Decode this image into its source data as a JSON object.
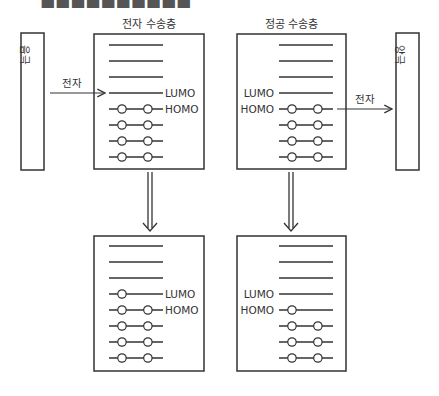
{
  "header_cut_text": "■■■■■■■■■■",
  "colors": {
    "stroke": "#333333",
    "text": "#333333",
    "background": "#ffffff"
  },
  "electrodes": {
    "left": {
      "label": "음극",
      "x": 21,
      "y": 33,
      "w": 23,
      "h": 137
    },
    "right": {
      "label": "양극",
      "x": 396,
      "y": 33,
      "w": 23,
      "h": 137
    }
  },
  "arrows": {
    "left_electron": {
      "label": "전자",
      "x1": 50,
      "x2": 105,
      "y": 93
    },
    "right_electron": {
      "label": "전자",
      "x1": 337,
      "x2": 392,
      "y": 109
    }
  },
  "panels": [
    {
      "id": "etl-before",
      "title": "전자 수송층",
      "box": {
        "x": 94,
        "y": 34,
        "w": 110,
        "h": 135
      },
      "line_x1": 109,
      "line_x2": 163,
      "label_side": "right",
      "levels": [
        {
          "y": 45,
          "electrons": 0
        },
        {
          "y": 61,
          "electrons": 0
        },
        {
          "y": 77,
          "electrons": 0
        },
        {
          "y": 93,
          "electrons": 0,
          "label": "LUMO"
        },
        {
          "y": 109,
          "electrons": 2,
          "label": "HOMO"
        },
        {
          "y": 125,
          "electrons": 2
        },
        {
          "y": 141,
          "electrons": 2
        },
        {
          "y": 157,
          "electrons": 2
        }
      ]
    },
    {
      "id": "htl-before",
      "title": "정공 수송층",
      "box": {
        "x": 237,
        "y": 34,
        "w": 109,
        "h": 135
      },
      "line_x1": 279,
      "line_x2": 333,
      "label_side": "left",
      "levels": [
        {
          "y": 45,
          "electrons": 0
        },
        {
          "y": 61,
          "electrons": 0
        },
        {
          "y": 77,
          "electrons": 0
        },
        {
          "y": 93,
          "electrons": 0,
          "label": "LUMO"
        },
        {
          "y": 109,
          "electrons": 2,
          "label": "HOMO"
        },
        {
          "y": 125,
          "electrons": 2
        },
        {
          "y": 141,
          "electrons": 2
        },
        {
          "y": 157,
          "electrons": 2
        }
      ]
    },
    {
      "id": "etl-after",
      "title": "",
      "box": {
        "x": 94,
        "y": 236,
        "w": 110,
        "h": 135
      },
      "line_x1": 109,
      "line_x2": 163,
      "label_side": "right",
      "levels": [
        {
          "y": 246,
          "electrons": 0
        },
        {
          "y": 262,
          "electrons": 0
        },
        {
          "y": 278,
          "electrons": 0
        },
        {
          "y": 294,
          "electrons": 1,
          "label": "LUMO"
        },
        {
          "y": 310,
          "electrons": 2,
          "label": "HOMO"
        },
        {
          "y": 326,
          "electrons": 2
        },
        {
          "y": 342,
          "electrons": 2
        },
        {
          "y": 358,
          "electrons": 2
        }
      ]
    },
    {
      "id": "htl-after",
      "title": "",
      "box": {
        "x": 237,
        "y": 236,
        "w": 109,
        "h": 135
      },
      "line_x1": 279,
      "line_x2": 333,
      "label_side": "left",
      "levels": [
        {
          "y": 246,
          "electrons": 0
        },
        {
          "y": 262,
          "electrons": 0
        },
        {
          "y": 278,
          "electrons": 0
        },
        {
          "y": 294,
          "electrons": 0,
          "label": "LUMO"
        },
        {
          "y": 310,
          "electrons": 1,
          "label": "HOMO"
        },
        {
          "y": 326,
          "electrons": 2
        },
        {
          "y": 342,
          "electrons": 2
        },
        {
          "y": 358,
          "electrons": 2
        }
      ]
    }
  ],
  "transition_arrows": [
    {
      "x": 150,
      "y1": 172,
      "y2": 231
    },
    {
      "x": 291,
      "y1": 172,
      "y2": 231
    }
  ]
}
